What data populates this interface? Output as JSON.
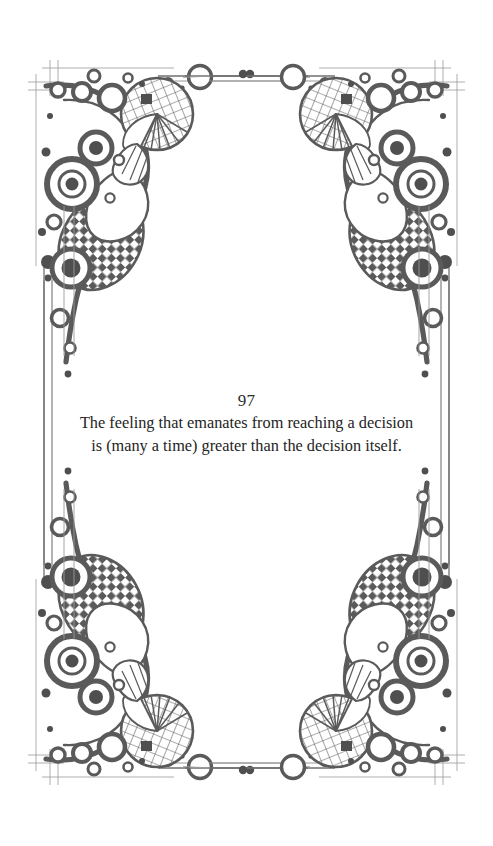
{
  "page": {
    "background_color": "#ffffff",
    "width": 493,
    "height": 846
  },
  "quote": {
    "number": "97",
    "line1": "The feeling that emanates from reaching a decision",
    "line2": "is (many a time) greater than the decision itself.",
    "full_text": "The feeling that emanates from reaching a decision is (many a time) greater than the decision itself.",
    "text_color": "#242424"
  },
  "ornament": {
    "ink_color": "#5a5a5a",
    "ink_color_dark": "#4f4f4f",
    "hairline_color": "#8c8c8c",
    "description": "Art-deco decorative page frame with four mirrored corner ornaments composed of concentric rings, dotted circles, checkerboard teardrops and gridded shell fans, joined by double hairline rules with circle-and-dot punctuation.",
    "corners": [
      "top-left",
      "top-right",
      "bottom-left",
      "bottom-right"
    ],
    "rules": [
      "top-horizontal",
      "bottom-horizontal",
      "left-vertical",
      "right-vertical"
    ]
  }
}
